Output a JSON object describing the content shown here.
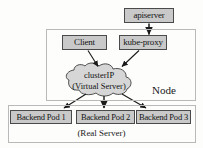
{
  "diagram": {
    "nodes": {
      "apiserver": {
        "label": "apiserver"
      },
      "client": {
        "label": "Client"
      },
      "kube_proxy": {
        "label": "kube-proxy"
      },
      "cluster_ip": {
        "label_line1": "clusterIP",
        "label_line2": "(Virtual Server)"
      },
      "backend_pod_1": {
        "label": "Backend Pod 1"
      },
      "backend_pod_2": {
        "label": "Backend Pod 2"
      },
      "backend_pod_3": {
        "label": "Backend Pod 3"
      }
    },
    "containers": {
      "node": {
        "label": "Node"
      },
      "real_server": {
        "label": "(Real Server)"
      }
    },
    "colors": {
      "box_fill": "#c9c9c9",
      "box_border": "#4a4a4a",
      "frame_border": "#b9b9b9",
      "arrow": "#1a1a1a",
      "cloud_fill": "#d6d6d6",
      "background": "#fdfdfc"
    },
    "edges": [
      {
        "from": "apiserver",
        "to": "kube_proxy"
      },
      {
        "from": "client",
        "to": "cluster_ip"
      },
      {
        "from": "kube_proxy",
        "to": "cluster_ip"
      },
      {
        "from": "cluster_ip",
        "to": "backend_pod_1"
      },
      {
        "from": "cluster_ip",
        "to": "backend_pod_2"
      },
      {
        "from": "cluster_ip",
        "to": "backend_pod_3"
      }
    ]
  }
}
